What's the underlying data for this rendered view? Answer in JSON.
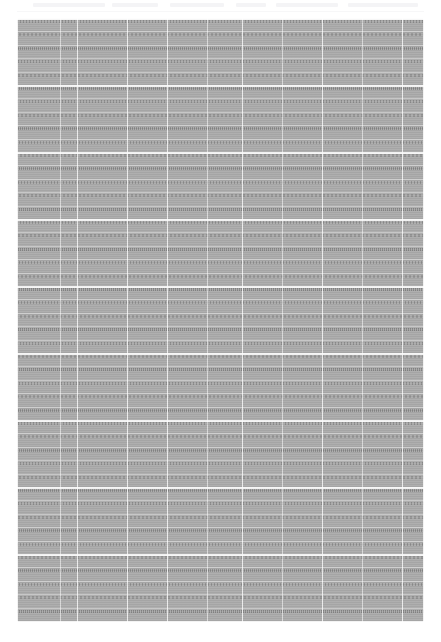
{
  "page": {
    "width": 441,
    "height": 642,
    "background_color": "#ffffff",
    "kind": "scanned-tabular-document"
  },
  "header": {
    "visible": true,
    "note": "faint light-gray ghost text band, illegible at this resolution",
    "band_color": "#f4f4f6",
    "rule_color": "#f7f7f8",
    "ghost_segments": [
      {
        "left": 33,
        "width": 72
      },
      {
        "left": 112,
        "width": 46
      },
      {
        "left": 170,
        "width": 54
      },
      {
        "left": 236,
        "width": 30
      },
      {
        "left": 276,
        "width": 62
      },
      {
        "left": 348,
        "width": 70
      }
    ]
  },
  "table": {
    "left": 17,
    "top": 18,
    "width": 407,
    "height": 604,
    "fill_color": "#a8a8a8",
    "rule_color": "#ffffff",
    "text_legible": false,
    "text_note": "cell text is not resolvable at 441x642 — rendered as glyph texture",
    "column_separators": [
      {
        "x": 43,
        "strong": false
      },
      {
        "x": 60,
        "strong": true
      },
      {
        "x": 110,
        "strong": true
      },
      {
        "x": 150,
        "strong": true
      },
      {
        "x": 190,
        "strong": false
      },
      {
        "x": 225,
        "strong": true
      },
      {
        "x": 265,
        "strong": false
      },
      {
        "x": 305,
        "strong": true
      },
      {
        "x": 345,
        "strong": false
      },
      {
        "x": 385,
        "strong": true
      }
    ],
    "row_count": 45,
    "row_pitch": 13.4,
    "band_rows": [
      0,
      5,
      10,
      15,
      20,
      25,
      30,
      35,
      40,
      45
    ]
  }
}
